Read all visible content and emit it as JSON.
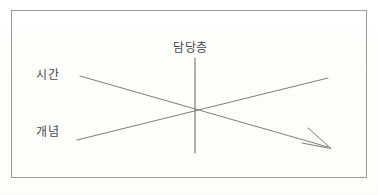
{
  "figure": {
    "type": "diagram",
    "background_color": "#fdfdfc",
    "border_color": "#9a9a9a",
    "line_color": "#6e6e6e",
    "text_color": "#4a4a4a"
  },
  "labels": {
    "time": "시간",
    "concept": "개념",
    "level": "담당층"
  },
  "axes": {
    "vertical": {
      "name": "level-axis",
      "label": "담당층",
      "x": 195,
      "y_top": 58,
      "y_bottom": 153
    },
    "descending": {
      "name": "time-line",
      "label": "시간",
      "x1": 80,
      "y1": 76,
      "x2": 330,
      "y2": 148,
      "arrow": "end"
    },
    "ascending": {
      "name": "concept-line",
      "label": "개념",
      "x1": 77,
      "y1": 140,
      "x2": 328,
      "y2": 78,
      "arrow": "none"
    },
    "intersection": {
      "x": 195,
      "y": 112
    }
  },
  "frame": {
    "name": "diagram-border",
    "x": 11,
    "y": 10,
    "width": 356,
    "height": 168
  }
}
